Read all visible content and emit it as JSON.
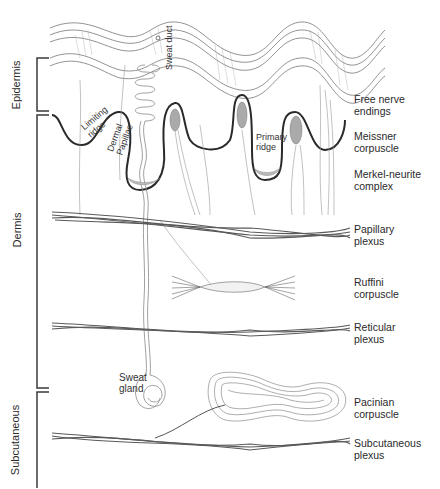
{
  "figure": {
    "type": "anatomical cross-section of skin with mechanoreceptors",
    "layers": [
      {
        "name": "Epidermis"
      },
      {
        "name": "Dermis"
      },
      {
        "name": "Subcutaneous"
      }
    ],
    "inline_labels": {
      "sweat_duct": [
        "Sweat",
        "duct"
      ],
      "limiting_ridge": [
        "Limiting",
        "ridge"
      ],
      "dermal_papillae": [
        "Dermal",
        "Papillae"
      ],
      "primary_ridge": [
        "Primary",
        "ridge"
      ],
      "sweat_gland": [
        "Sweat",
        "gland"
      ]
    },
    "right_labels": [
      {
        "id": "free_nerve_endings",
        "lines": [
          "Free nerve",
          "endings"
        ]
      },
      {
        "id": "meissner_corpuscle",
        "lines": [
          "Meissner",
          "corpuscle"
        ]
      },
      {
        "id": "merkel_neurite_complex",
        "lines": [
          "Merkel-neurite",
          "complex"
        ]
      },
      {
        "id": "papillary_plexus",
        "lines": [
          "Papillary",
          "plexus"
        ]
      },
      {
        "id": "ruffini_corpuscle",
        "lines": [
          "Ruffini",
          "corpuscle"
        ]
      },
      {
        "id": "reticular_plexus",
        "lines": [
          "Reticular",
          "plexus"
        ]
      },
      {
        "id": "pacinian_corpuscle",
        "lines": [
          "Pacinian",
          "corpuscle"
        ]
      },
      {
        "id": "subcutaneous_plexus",
        "lines": [
          "Subcutaneous",
          "plexus"
        ]
      }
    ],
    "colors": {
      "line": "#3a3a3a",
      "thin_line": "#8a8a8a",
      "plexus": "#5a5a5a",
      "receptor_fill": "#b0b0b0"
    }
  }
}
